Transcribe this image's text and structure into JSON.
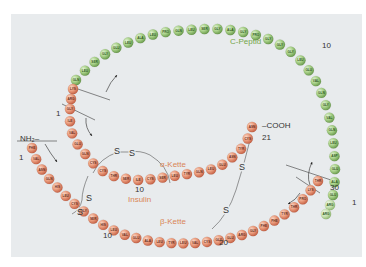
{
  "diagram": {
    "labels": {
      "c_peptide": "C-Peptid",
      "alpha_chain": "α-Kette",
      "beta_chain": "β-Kette",
      "insulin": "Insulin",
      "nh2": "NH₂–",
      "cooh": "–COOH",
      "ss": "S"
    },
    "numbers": {
      "alpha_start": "1",
      "alpha_10": "10",
      "alpha_end": "21",
      "beta_start": "1",
      "beta_10": "10",
      "beta_20": "20",
      "beta_30": "30",
      "c_start": "1",
      "c_10": "10"
    },
    "colors": {
      "background": "#e8ebed",
      "alpha_beta_bead": "#e89a7c",
      "c_peptide_bead": "#a6cf86",
      "text_orange": "#d98556",
      "text_green": "#74a64a"
    },
    "c_peptide_residues": [
      "GLU",
      "ALA",
      "GLU",
      "ASP",
      "LEU",
      "GLN",
      "VAL",
      "GLY",
      "GLN",
      "VAL",
      "GLU",
      "LEU",
      "GLY",
      "GLY",
      "GLY",
      "PRO",
      "GLY",
      "ALA",
      "GLY",
      "SER",
      "LEU",
      "GLN",
      "PRO",
      "LEU",
      "ALA",
      "LEU",
      "GLU",
      "GLY",
      "SER",
      "LEU",
      "GLN"
    ],
    "alpha_residues": [
      "GLY",
      "ILE",
      "VAL",
      "GLU",
      "GLN",
      "CYS",
      "CYS",
      "THR",
      "SER",
      "ILE",
      "CYS",
      "SER",
      "LEU",
      "TYR",
      "GLN",
      "LEU",
      "GLU",
      "ASN",
      "TYR",
      "CYS",
      "ASN"
    ],
    "beta_residues": [
      "PHE",
      "VAL",
      "ASN",
      "GLN",
      "HIS",
      "LEU",
      "CYS",
      "GLY",
      "SER",
      "HIS",
      "LEU",
      "VAL",
      "GLU",
      "ALA",
      "LEU",
      "TYR",
      "LEU",
      "VAL",
      "CYS",
      "GLY",
      "GLU",
      "ARG",
      "GLY",
      "PHE",
      "PHE",
      "TYR",
      "THR",
      "PRO",
      "LYS",
      "THR"
    ],
    "linker_residues": [
      "ARG",
      "ARG",
      "LYS",
      "ARG"
    ]
  }
}
